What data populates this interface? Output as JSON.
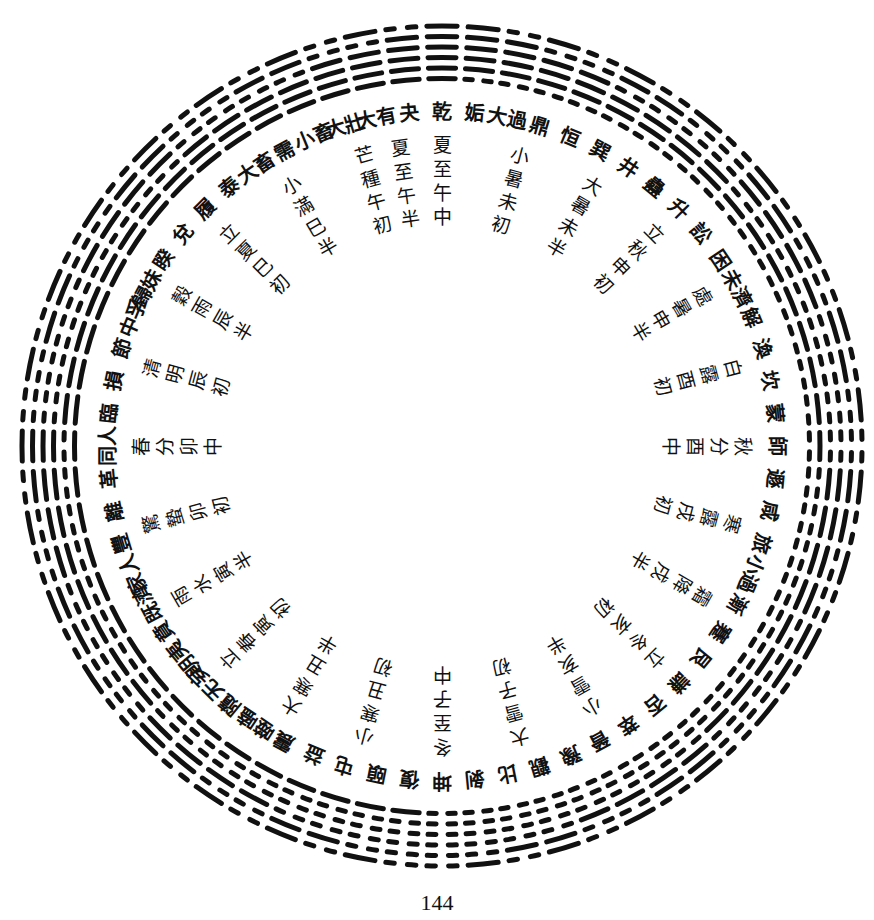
{
  "figure": {
    "title": "",
    "type": "circular hexagram diagram with solar terms",
    "center": {
      "x": 442,
      "y": 446
    },
    "outer_radius": 424,
    "line_spacing": 10.5,
    "hexagrams_clockwise_from_top": [
      {
        "name": "乾",
        "lines": "111111"
      },
      {
        "name": "姤",
        "lines": "111110"
      },
      {
        "name": "大過",
        "lines": "011110"
      },
      {
        "name": "鼎",
        "lines": "101110"
      },
      {
        "name": "恒",
        "lines": "001110"
      },
      {
        "name": "巽",
        "lines": "110110"
      },
      {
        "name": "井",
        "lines": "010110"
      },
      {
        "name": "蠱",
        "lines": "100110"
      },
      {
        "name": "升",
        "lines": "000110"
      },
      {
        "name": "訟",
        "lines": "111010"
      },
      {
        "name": "困",
        "lines": "011010"
      },
      {
        "name": "未濟",
        "lines": "101010"
      },
      {
        "name": "解",
        "lines": "001010"
      },
      {
        "name": "渙",
        "lines": "110010"
      },
      {
        "name": "坎",
        "lines": "010010"
      },
      {
        "name": "蒙",
        "lines": "100010"
      },
      {
        "name": "師",
        "lines": "000010"
      },
      {
        "name": "遯",
        "lines": "111100"
      },
      {
        "name": "咸",
        "lines": "011100"
      },
      {
        "name": "旅",
        "lines": "101100"
      },
      {
        "name": "小過",
        "lines": "001100"
      },
      {
        "name": "漸",
        "lines": "110100"
      },
      {
        "name": "蹇",
        "lines": "010100"
      },
      {
        "name": "艮",
        "lines": "100100"
      },
      {
        "name": "謙",
        "lines": "000100"
      },
      {
        "name": "否",
        "lines": "111000"
      },
      {
        "name": "萃",
        "lines": "011000"
      },
      {
        "name": "晉",
        "lines": "101000"
      },
      {
        "name": "豫",
        "lines": "001000"
      },
      {
        "name": "觀",
        "lines": "110000"
      },
      {
        "name": "比",
        "lines": "010000"
      },
      {
        "name": "剝",
        "lines": "100000"
      },
      {
        "name": "坤",
        "lines": "000000"
      },
      {
        "name": "復",
        "lines": "000001"
      },
      {
        "name": "頤",
        "lines": "100001"
      },
      {
        "name": "屯",
        "lines": "010001"
      },
      {
        "name": "益",
        "lines": "110001"
      },
      {
        "name": "震",
        "lines": "001001"
      },
      {
        "name": "噬嗑",
        "lines": "101001"
      },
      {
        "name": "隨",
        "lines": "011001"
      },
      {
        "name": "无妄",
        "lines": "111001"
      },
      {
        "name": "明夷",
        "lines": "000101"
      },
      {
        "name": "賁",
        "lines": "100101"
      },
      {
        "name": "既濟",
        "lines": "010101"
      },
      {
        "name": "家人",
        "lines": "110101"
      },
      {
        "name": "豐",
        "lines": "001101"
      },
      {
        "name": "離",
        "lines": "101101"
      },
      {
        "name": "革",
        "lines": "011101"
      },
      {
        "name": "同人",
        "lines": "111101"
      },
      {
        "name": "臨",
        "lines": "000011"
      },
      {
        "name": "損",
        "lines": "100011"
      },
      {
        "name": "節",
        "lines": "010011"
      },
      {
        "name": "中孚",
        "lines": "110011"
      },
      {
        "name": "歸妹",
        "lines": "001011"
      },
      {
        "name": "睽",
        "lines": "101011"
      },
      {
        "name": "兌",
        "lines": "011011"
      },
      {
        "name": "履",
        "lines": "111011"
      },
      {
        "name": "泰",
        "lines": "000111"
      },
      {
        "name": "大畜",
        "lines": "100111"
      },
      {
        "name": "需",
        "lines": "010111"
      },
      {
        "name": "小畜",
        "lines": "110111"
      },
      {
        "name": "大壯",
        "lines": "001111"
      },
      {
        "name": "大有",
        "lines": "101111"
      },
      {
        "name": "夬",
        "lines": "011111"
      }
    ],
    "solar_terms_clockwise": [
      {
        "label": "夏至午中",
        "angle": 0
      },
      {
        "label": "小暑未初",
        "angle": 15
      },
      {
        "label": "大暑未半",
        "angle": 30
      },
      {
        "label": "立秋申初",
        "angle": 45
      },
      {
        "label": "處暑申半",
        "angle": 60
      },
      {
        "label": "白露酉初",
        "angle": 75
      },
      {
        "label": "秋分酉中",
        "angle": 90
      },
      {
        "label": "寒露戌初",
        "angle": 105
      },
      {
        "label": "霜降戌半",
        "angle": 120
      },
      {
        "label": "立冬亥初",
        "angle": 135
      },
      {
        "label": "小雪亥半",
        "angle": 150
      },
      {
        "label": "大雪子初",
        "angle": 165
      },
      {
        "label": "冬至子中",
        "angle": 180
      },
      {
        "label": "小寒丑初",
        "angle": 195
      },
      {
        "label": "大寒丑半",
        "angle": 210
      },
      {
        "label": "立春寅初",
        "angle": 225
      },
      {
        "label": "雨水寅半",
        "angle": 240
      },
      {
        "label": "驚蟄卯初",
        "angle": 255
      },
      {
        "label": "春分卯中",
        "angle": 270
      },
      {
        "label": "清明辰初",
        "angle": 285
      },
      {
        "label": "穀雨辰半",
        "angle": 300
      },
      {
        "label": "立夏巳初",
        "angle": 315
      },
      {
        "label": "小滿巳半",
        "angle": 330
      },
      {
        "label": "芒種午初",
        "angle": 345
      },
      {
        "label": "夏至午半",
        "angle": 352
      }
    ]
  },
  "page": {
    "number": "144"
  }
}
